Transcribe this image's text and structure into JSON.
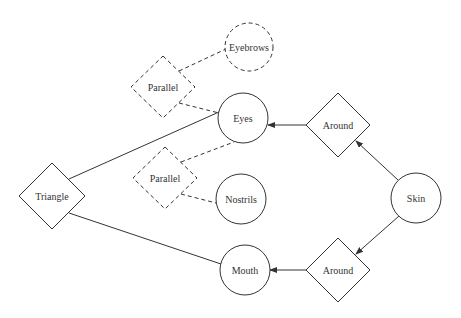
{
  "diagram": {
    "stroke_color": "#333333",
    "nodes": [
      {
        "id": "triangle",
        "label": "Triangle",
        "shape": "diamond",
        "style": "solid",
        "cx": 52,
        "cy": 196,
        "rx": 33,
        "ry": 33
      },
      {
        "id": "parallel_top",
        "label": "Parallel",
        "shape": "diamond",
        "style": "dashed",
        "cx": 163,
        "cy": 87,
        "rx": 32,
        "ry": 31
      },
      {
        "id": "parallel_bottom",
        "label": "Parallel",
        "shape": "diamond",
        "style": "dashed",
        "cx": 165,
        "cy": 178,
        "rx": 32,
        "ry": 31
      },
      {
        "id": "eyebrows",
        "label": "Eyebrows",
        "shape": "circle",
        "style": "dashed",
        "cx": 249,
        "cy": 47,
        "r": 24
      },
      {
        "id": "eyes",
        "label": "Eyes",
        "shape": "circle",
        "style": "solid",
        "cx": 243,
        "cy": 118,
        "r": 25
      },
      {
        "id": "nostrils",
        "label": "Nostrils",
        "shape": "circle",
        "style": "solid",
        "cx": 241,
        "cy": 199,
        "r": 25
      },
      {
        "id": "mouth",
        "label": "Mouth",
        "shape": "circle",
        "style": "solid",
        "cx": 245,
        "cy": 270,
        "r": 25
      },
      {
        "id": "around_top",
        "label": "Around",
        "shape": "diamond",
        "style": "solid",
        "cx": 338,
        "cy": 125,
        "rx": 32,
        "ry": 32
      },
      {
        "id": "around_bottom",
        "label": "Around",
        "shape": "diamond",
        "style": "solid",
        "cx": 338,
        "cy": 270,
        "rx": 32,
        "ry": 32
      },
      {
        "id": "skin",
        "label": "Skin",
        "shape": "circle",
        "style": "solid",
        "cx": 416,
        "cy": 198,
        "r": 25
      }
    ],
    "edges": [
      {
        "from": "triangle",
        "to": "eyes",
        "style": "solid",
        "arrow": false,
        "x1": 69,
        "y1": 179,
        "x2": 219,
        "y2": 112
      },
      {
        "from": "triangle",
        "to": "mouth",
        "style": "solid",
        "arrow": false,
        "x1": 69,
        "y1": 213,
        "x2": 221,
        "y2": 264
      },
      {
        "from": "parallel_top",
        "to": "eyebrows",
        "style": "dashed",
        "arrow": false,
        "x1": 179,
        "y1": 71,
        "x2": 226,
        "y2": 49
      },
      {
        "from": "parallel_top",
        "to": "eyes",
        "style": "dashed",
        "arrow": false,
        "x1": 179,
        "y1": 103,
        "x2": 219,
        "y2": 113
      },
      {
        "from": "parallel_bottom",
        "to": "eyes",
        "style": "dashed",
        "arrow": false,
        "x1": 181,
        "y1": 162,
        "x2": 234,
        "y2": 142
      },
      {
        "from": "parallel_bottom",
        "to": "nostrils",
        "style": "dashed",
        "arrow": false,
        "x1": 181,
        "y1": 194,
        "x2": 216,
        "y2": 203
      },
      {
        "from": "around_top",
        "to": "eyes",
        "style": "solid",
        "arrow": true,
        "x1": 306,
        "y1": 125,
        "x2": 268,
        "y2": 125
      },
      {
        "from": "skin",
        "to": "around_top",
        "style": "solid",
        "arrow": true,
        "x1": 398,
        "y1": 180,
        "x2": 356,
        "y2": 141
      },
      {
        "from": "around_bottom",
        "to": "mouth",
        "style": "solid",
        "arrow": true,
        "x1": 306,
        "y1": 270,
        "x2": 270,
        "y2": 270
      },
      {
        "from": "skin",
        "to": "around_bottom",
        "style": "solid",
        "arrow": true,
        "x1": 399,
        "y1": 216,
        "x2": 356,
        "y2": 254
      }
    ]
  }
}
